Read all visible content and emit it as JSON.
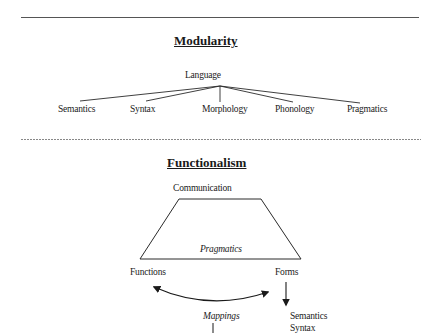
{
  "modularity": {
    "title": "Modularity",
    "root": "Language",
    "children": [
      "Semantics",
      "Syntax",
      "Morphology",
      "Phonology",
      "Pragmatics"
    ]
  },
  "functionalism": {
    "title": "Functionalism",
    "top_label": "Communication",
    "trapezoid_label": "Pragmatics",
    "left_label": "Functions",
    "right_label": "Forms",
    "mapping_label": "Mappings",
    "form_components": [
      "Semantics",
      "Syntax"
    ]
  },
  "colors": {
    "line": "#2a2a2a",
    "text": "#1a1a1a",
    "background": "#ffffff"
  }
}
